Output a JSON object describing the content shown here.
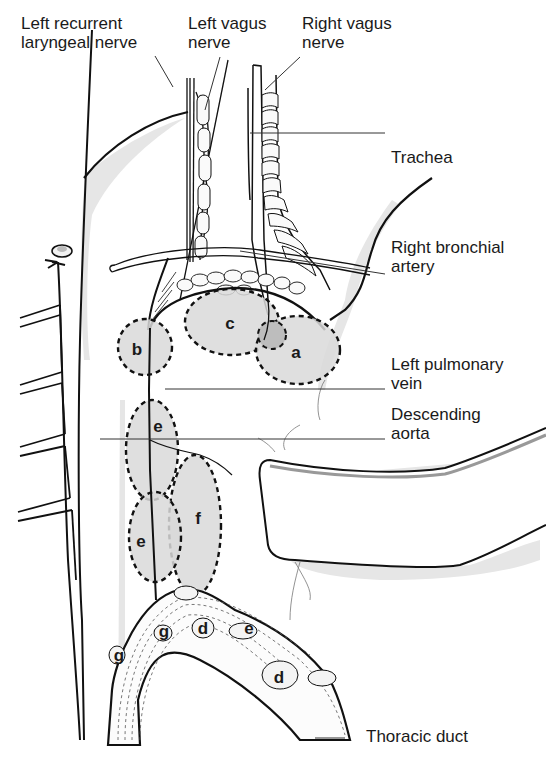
{
  "diagram": {
    "type": "anatomical-line-drawing",
    "labels": {
      "left_recurrent_laryngeal_nerve": "Left recurrent\nlaryngeal nerve",
      "left_vagus_nerve": "Left vagus\nnerve",
      "right_vagus_nerve": "Right vagus\nnerve",
      "trachea": "Trachea",
      "right_bronchial_artery": "Right bronchial\nartery",
      "left_pulmonary_vein": "Left pulmonary\nvein",
      "descending_aorta": "Descending\naorta",
      "thoracic_duct": "Thoracic duct"
    },
    "regions": {
      "a": "a",
      "b": "b",
      "c": "c",
      "e_upper": "e",
      "e_lower": "e",
      "f": "f",
      "d_upper": "d",
      "d_lower": "d",
      "e_node": "e",
      "g_upper": "g",
      "g_lower": "g"
    },
    "colors": {
      "line": "#111111",
      "shade": "#d9d9d9",
      "shade_dark": "#c4c4c4",
      "leader": "#333333"
    }
  }
}
